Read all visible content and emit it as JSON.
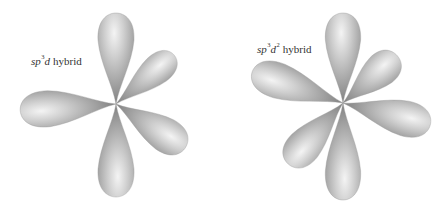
{
  "figure": {
    "panels": [
      {
        "id": "sp3d",
        "label": {
          "base": "sp",
          "exp1": "3",
          "orb": "d",
          "exp2": "",
          "word": "hybrid"
        },
        "lobe_count": 5
      },
      {
        "id": "sp3d2",
        "label": {
          "base": "sp",
          "exp1": "3",
          "orb": "d",
          "exp2": "2",
          "word": "hybrid"
        },
        "lobe_count": 6
      }
    ],
    "colors": {
      "lobe_light": "#f2f2f2",
      "lobe_mid": "#b5b5b5",
      "lobe_dark": "#7a7a7a",
      "text": "#333333"
    }
  }
}
